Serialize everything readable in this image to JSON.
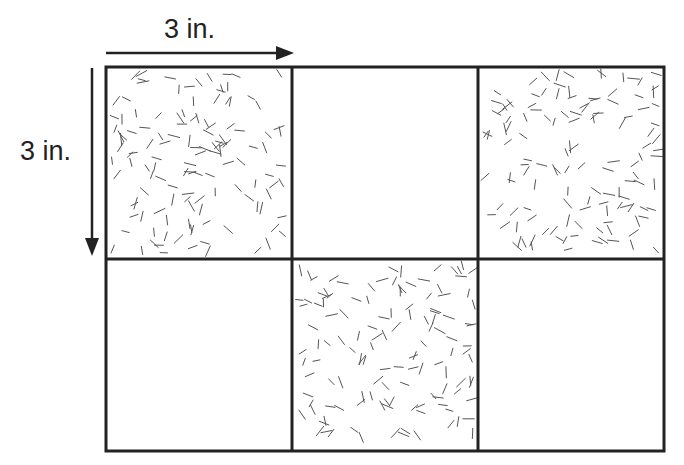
{
  "diagram": {
    "top_label": "3 in.",
    "side_label": "3 in.",
    "grid": {
      "rows": 2,
      "cols": 3,
      "cell_size_label": "3 in.",
      "cells": [
        {
          "row": 0,
          "col": 0,
          "shaded": true
        },
        {
          "row": 0,
          "col": 1,
          "shaded": false
        },
        {
          "row": 0,
          "col": 2,
          "shaded": true
        },
        {
          "row": 1,
          "col": 0,
          "shaded": false
        },
        {
          "row": 1,
          "col": 1,
          "shaded": true
        },
        {
          "row": 1,
          "col": 2,
          "shaded": false
        }
      ]
    },
    "colors": {
      "line": "#222222",
      "hatch": "#555555",
      "background": "#ffffff"
    }
  }
}
